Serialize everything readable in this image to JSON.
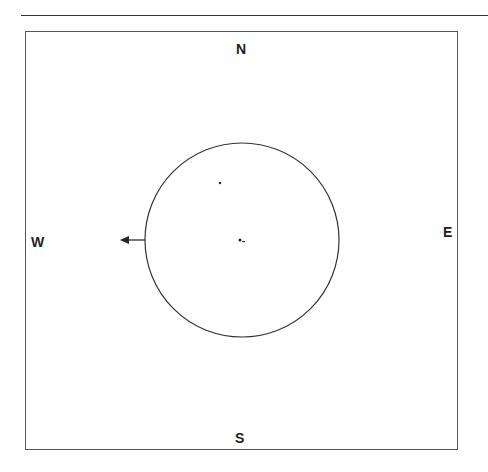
{
  "diagram": {
    "type": "compass-position-plot",
    "directions": {
      "north": "N",
      "south": "S",
      "east": "E",
      "west": "W"
    },
    "circle": {
      "cx": 242,
      "cy": 240,
      "r": 97
    },
    "arrow": {
      "direction": "west",
      "from_x": 145,
      "to_x": 120,
      "y": 240
    },
    "points": [
      {
        "x": 220,
        "y": 183
      },
      {
        "x": 240,
        "y": 240
      },
      {
        "x": 243,
        "y": 242
      }
    ],
    "colors": {
      "stroke": "#333333",
      "background": "#ffffff"
    }
  }
}
